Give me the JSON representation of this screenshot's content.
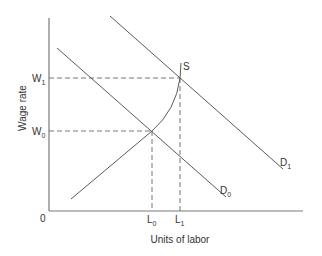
{
  "diagram": {
    "type": "labor-market supply and demand",
    "y_axis_label": "Wage rate",
    "x_axis_label": "Units of labor",
    "origin_label": "0",
    "y_ticks": [
      {
        "main": "W",
        "sub": "1"
      },
      {
        "main": "W",
        "sub": "0"
      }
    ],
    "x_ticks": [
      {
        "main": "L",
        "sub": "0"
      },
      {
        "main": "L",
        "sub": "1"
      }
    ],
    "curves": {
      "supply": {
        "label": "S"
      },
      "demand_0": {
        "main": "D",
        "sub": "0"
      },
      "demand_1": {
        "main": "D",
        "sub": "1"
      }
    },
    "colors": {
      "axis": "#7a7a7a",
      "curve": "#5a5a5a",
      "text": "#333333",
      "background": "#ffffff"
    }
  }
}
